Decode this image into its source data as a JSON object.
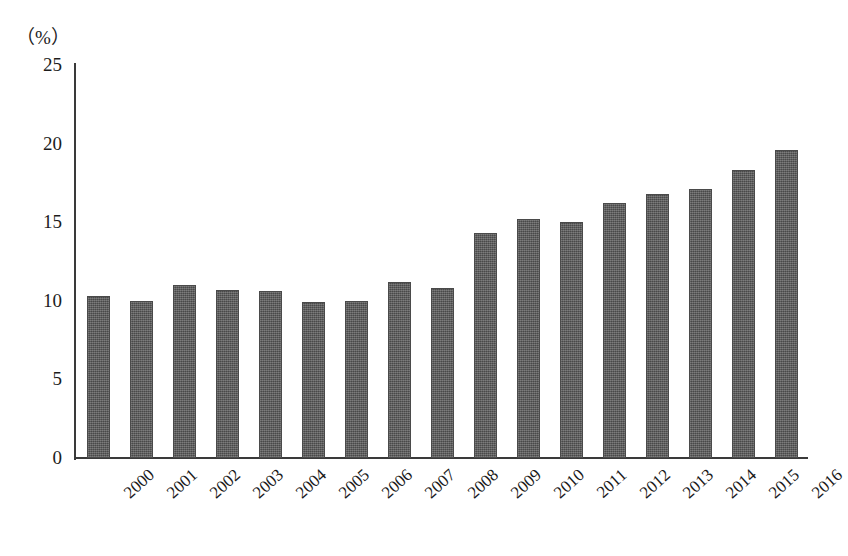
{
  "chart_data": {
    "type": "bar",
    "title": "",
    "subtitle": "",
    "xlabel": "",
    "ylabel": "",
    "unit_label": "（%）",
    "ylim": [
      0,
      25
    ],
    "yticks": [
      0,
      5,
      10,
      15,
      20,
      25
    ],
    "ytick_labels": [
      "0",
      "5",
      "10",
      "15",
      "20",
      "25"
    ],
    "grid": false,
    "legend": null,
    "legend_position": "none",
    "bar_color": "#585858",
    "bar_edge_color": "#4a4a4a",
    "background_color": "#ffffff",
    "axis_color": "#3a3a3a",
    "categories": [
      "2000",
      "2001",
      "2002",
      "2003",
      "2004",
      "2005",
      "2006",
      "2007",
      "2008",
      "2009",
      "2010",
      "2011",
      "2012",
      "2013",
      "2014",
      "2015",
      "2016"
    ],
    "values": [
      10.3,
      10.0,
      11.0,
      10.7,
      10.6,
      9.9,
      10.0,
      11.2,
      10.8,
      14.3,
      15.2,
      15.0,
      16.2,
      16.8,
      17.1,
      18.3,
      19.6
    ]
  }
}
